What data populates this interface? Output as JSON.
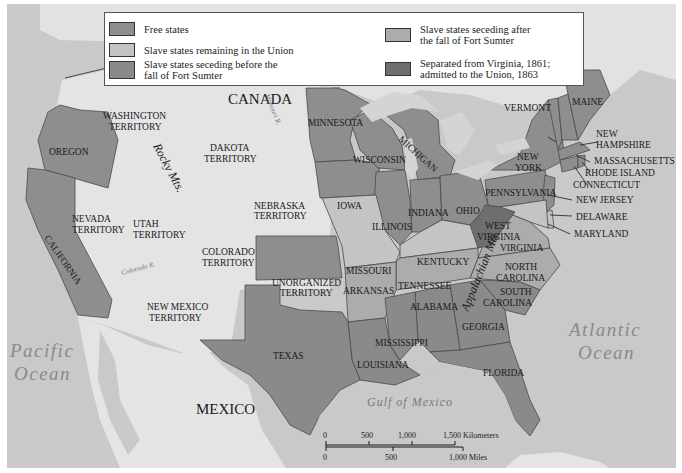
{
  "legend": {
    "items": [
      {
        "label": "Free states",
        "color": "#8e8e8e"
      },
      {
        "label": "Slave states remaining in the Union",
        "color": "#c4c4c4"
      },
      {
        "label": "Slave states seceding before the fall of Fort Sumter",
        "line1": "Slave states seceding before the",
        "line2": "fall of Fort Sumter",
        "color": "#8a8a8a"
      },
      {
        "label": "Slave states seceding after the fall of Fort Sumter",
        "line1": "Slave states seceding after",
        "line2": "the fall of Fort Sumter",
        "color": "#acacac"
      },
      {
        "label": "Separated from Virginia, 1861; admitted to the Union, 1863",
        "line1": "Separated from Virginia, 1861;",
        "line2": "admitted to the Union, 1863",
        "color": "#6e6e6e"
      }
    ]
  },
  "colors": {
    "ocean": "#c9c9c9",
    "land": "#e4e4e4",
    "free": "#8e8e8e",
    "border_slave": "#c4c4c4",
    "seceded_before": "#8a8a8a",
    "seceded_after": "#acacac",
    "west_virginia": "#6e6e6e",
    "frame": "#ffffff"
  },
  "countries": {
    "canada": "CANADA",
    "mexico": "MEXICO"
  },
  "water": {
    "pacific_1": "Pacific",
    "pacific_2": "Ocean",
    "atlantic_1": "Atlantic",
    "atlantic_2": "Ocean",
    "gulf": "Gulf of Mexico"
  },
  "mountains": {
    "rocky": "Rocky Mts.",
    "appalachian": "Appalachian Mts."
  },
  "rivers": {
    "missouri": "Missouri R.",
    "colorado": "Colorado R.",
    "mississippi": "Mississippi R.",
    "ohio": "Ohio R.",
    "hudson": "Hudson R."
  },
  "territories": {
    "washington_1": "WASHINGTON",
    "washington_2": "TERRITORY",
    "dakota_1": "DAKOTA",
    "dakota_2": "TERRITORY",
    "nebraska_1": "NEBRASKA",
    "nebraska_2": "TERRITORY",
    "nevada_1": "NEVADA",
    "nevada_2": "TERRITORY",
    "utah_1": "UTAH",
    "utah_2": "TERRITORY",
    "colorado_1": "COLORADO",
    "colorado_2": "TERRITORY",
    "newmexico_1": "NEW MEXICO",
    "newmexico_2": "TERRITORY",
    "unorganized_1": "UNORGANIZED",
    "unorganized_2": "TERRITORY"
  },
  "states": {
    "oregon": "OREGON",
    "california": "CALIFORNIA",
    "minnesota": "MINNESOTA",
    "iowa": "IOWA",
    "kansas": "KANSAS",
    "wisconsin": "WISCONSIN",
    "michigan": "MICHIGAN",
    "illinois": "ILLINOIS",
    "indiana": "INDIANA",
    "ohio": "OHIO",
    "pennsylvania": "PENNSYLVANIA",
    "newyork_1": "NEW",
    "newyork_2": "YORK",
    "vermont": "VERMONT",
    "maine": "MAINE",
    "newhampshire_1": "NEW",
    "newhampshire_2": "HAMPSHIRE",
    "massachusetts": "MASSACHUSETTS",
    "rhodeisland": "RHODE ISLAND",
    "connecticut": "CONNECTICUT",
    "newjersey": "NEW JERSEY",
    "delaware": "DELAWARE",
    "maryland": "MARYLAND",
    "westvirginia_1": "WEST",
    "westvirginia_2": "VIRGINIA",
    "virginia": "VIRGINIA",
    "kentucky": "KENTUCKY",
    "missouri": "MISSOURI",
    "arkansas": "ARKANSAS",
    "tennessee": "TENNESSEE",
    "northcarolina_1": "NORTH",
    "northcarolina_2": "CAROLINA",
    "southcarolina_1": "SOUTH",
    "southcarolina_2": "CAROLINA",
    "alabama": "ALABAMA",
    "georgia": "GEORGIA",
    "mississippi": "MISSISSIPPI",
    "louisiana": "LOUISIANA",
    "texas": "TEXAS",
    "florida": "FLORIDA"
  },
  "scale_bar": {
    "km_ticks": [
      "0",
      "500",
      "1,000",
      "1,500 Kilometers"
    ],
    "mi_ticks": [
      "0",
      "500",
      "1,000 Miles"
    ]
  }
}
